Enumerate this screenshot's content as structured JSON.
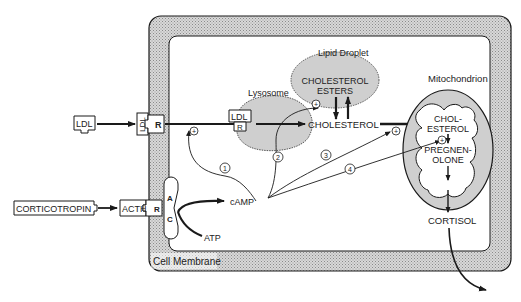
{
  "diagram": {
    "labels": {
      "cell_membrane": "Cell Membrane",
      "lysosome": "Lysosome",
      "lipid_droplet": "Lipid Droplet",
      "mitochondrion": "Mitochondrion",
      "ldl": "LDL",
      "ldl_receptor_ligand": "LDL",
      "receptor": "R",
      "lysosome_ldl": "LDL",
      "lysosome_r": "R",
      "cholesterol_esters_1": "CHOLESTEROL",
      "cholesterol_esters_2": "ESTERS",
      "cholesterol": "CHOLESTEROL",
      "mito_cholesterol_1": "CHOL-",
      "mito_cholesterol_2": "ESTEROL",
      "pregnenolone_1": "PREGNEN-",
      "pregnenolone_2": "OLONE",
      "cortisol": "CORTISOL",
      "corticotropin": "CORTICOTROPIN",
      "acth": "ACTH",
      "acth_receptor": "R",
      "ac_a": "A",
      "ac_c": "C",
      "camp": "cAMP",
      "atp": "ATP",
      "plus": "+",
      "path_1": "1",
      "path_2": "2",
      "path_3": "3",
      "path_4": "4"
    },
    "colors": {
      "membrane_fill": "#c8c8c8",
      "organelle_fill": "#cfcfcf",
      "stroke": "#1a1a1a",
      "background": "#ffffff"
    }
  }
}
